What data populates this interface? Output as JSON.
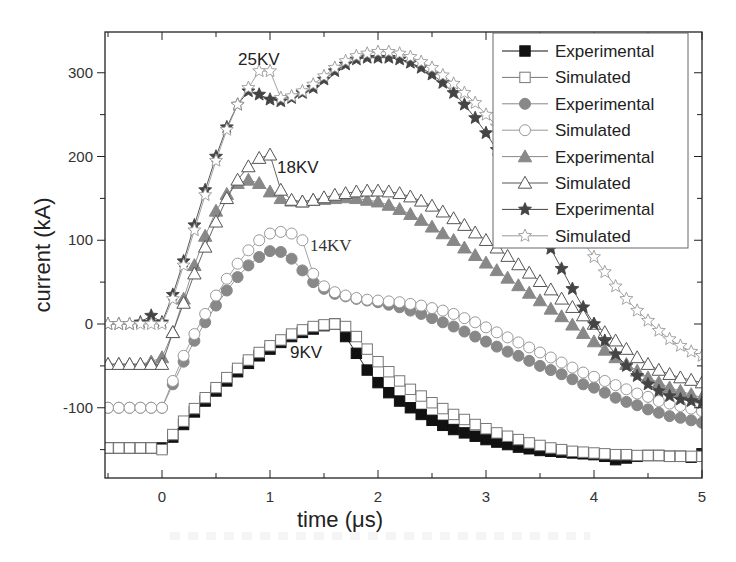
{
  "chart_data": {
    "type": "line",
    "title": "",
    "xlabel": "time (μs)",
    "ylabel": "current (kA)",
    "xlim": [
      -0.55,
      5.0
    ],
    "ylim": [
      -185,
      350
    ],
    "x_ticks": [
      0,
      1,
      2,
      3,
      4,
      5
    ],
    "y_ticks": [
      -100,
      0,
      100,
      200,
      300
    ],
    "grid": false,
    "legend_position": "upper right",
    "annotations": [
      {
        "text": "25KV",
        "x": 0.97,
        "y": 320
      },
      {
        "text": "18KV",
        "x": 1.25,
        "y": 185
      },
      {
        "text": "14KV",
        "x": 1.5,
        "y": 95
      },
      {
        "text": "9KV",
        "x": 1.23,
        "y": -15
      }
    ],
    "series": [
      {
        "name": "Experimental",
        "group": "9KV",
        "marker": "filled-square",
        "color": "#111111",
        "x": [
          -0.5,
          -0.4,
          -0.3,
          -0.2,
          -0.1,
          0.0,
          0.1,
          0.2,
          0.3,
          0.4,
          0.5,
          0.6,
          0.7,
          0.8,
          0.9,
          1.0,
          1.1,
          1.2,
          1.3,
          1.4,
          1.5,
          1.6,
          1.7,
          1.8,
          1.9,
          2.0,
          2.1,
          2.2,
          2.3,
          2.4,
          2.5,
          2.6,
          2.7,
          2.8,
          2.9,
          3.0,
          3.1,
          3.2,
          3.3,
          3.4,
          3.5,
          3.6,
          3.7,
          3.8,
          3.9,
          4.0,
          4.1,
          4.2,
          4.3,
          4.4,
          4.5,
          4.6,
          4.7,
          4.8,
          4.9,
          5.0
        ],
        "y": [
          -148,
          -148,
          -148,
          -148,
          -148,
          -148,
          -135,
          -120,
          -105,
          -92,
          -80,
          -68,
          -57,
          -47,
          -38,
          -30,
          -22,
          -15,
          -10,
          -6,
          -2,
          0,
          -15,
          -35,
          -55,
          -70,
          -82,
          -92,
          -100,
          -108,
          -115,
          -121,
          -126,
          -130,
          -134,
          -138,
          -141,
          -144,
          -147,
          -149,
          -151,
          -152,
          -153,
          -154,
          -155,
          -156,
          -158,
          -162,
          -160,
          -158,
          -157,
          -157,
          -158,
          -158,
          -159,
          -155
        ]
      },
      {
        "name": "Simulated",
        "group": "9KV",
        "marker": "open-square",
        "color": "#777777",
        "x": [
          -0.5,
          -0.4,
          -0.3,
          -0.2,
          -0.1,
          0.0,
          0.1,
          0.2,
          0.3,
          0.4,
          0.5,
          0.6,
          0.7,
          0.8,
          0.9,
          1.0,
          1.1,
          1.2,
          1.3,
          1.4,
          1.5,
          1.6,
          1.7,
          1.8,
          1.9,
          2.0,
          2.1,
          2.2,
          2.3,
          2.4,
          2.5,
          2.6,
          2.7,
          2.8,
          2.9,
          3.0,
          3.1,
          3.2,
          3.3,
          3.4,
          3.5,
          3.6,
          3.7,
          3.8,
          3.9,
          4.0,
          4.1,
          4.2,
          4.3,
          4.4,
          4.5,
          4.6,
          4.7,
          4.8,
          4.9,
          5.0
        ],
        "y": [
          -148,
          -148,
          -148,
          -148,
          -148,
          -150,
          -132,
          -116,
          -101,
          -88,
          -76,
          -64,
          -53,
          -43,
          -34,
          -26,
          -19,
          -12,
          -7,
          -3,
          -1,
          0,
          -3,
          -15,
          -30,
          -45,
          -57,
          -68,
          -78,
          -86,
          -94,
          -101,
          -108,
          -114,
          -120,
          -125,
          -130,
          -134,
          -138,
          -142,
          -145,
          -148,
          -150,
          -152,
          -153,
          -154,
          -155,
          -156,
          -156,
          -157,
          -157,
          -157,
          -158,
          -158,
          -158,
          -158
        ]
      },
      {
        "name": "Experimental",
        "group": "14KV",
        "marker": "filled-circle",
        "color": "#888888",
        "x": [
          -0.5,
          -0.4,
          -0.3,
          -0.2,
          -0.1,
          0.0,
          0.1,
          0.2,
          0.3,
          0.4,
          0.5,
          0.6,
          0.7,
          0.8,
          0.9,
          1.0,
          1.1,
          1.2,
          1.3,
          1.4,
          1.5,
          1.6,
          1.7,
          1.8,
          1.9,
          2.0,
          2.1,
          2.2,
          2.3,
          2.4,
          2.5,
          2.6,
          2.7,
          2.8,
          2.9,
          3.0,
          3.1,
          3.2,
          3.3,
          3.4,
          3.5,
          3.6,
          3.7,
          3.8,
          3.9,
          4.0,
          4.1,
          4.2,
          4.3,
          4.4,
          4.5,
          4.6,
          4.7,
          4.8,
          4.9,
          5.0
        ],
        "y": [
          -100,
          -100,
          -100,
          -100,
          -100,
          -100,
          -72,
          -45,
          -20,
          2,
          22,
          40,
          56,
          70,
          80,
          87,
          86,
          78,
          64,
          50,
          42,
          36,
          33,
          30,
          28,
          26,
          23,
          20,
          16,
          12,
          7,
          2,
          -3,
          -9,
          -15,
          -21,
          -27,
          -33,
          -38,
          -44,
          -50,
          -55,
          -60,
          -66,
          -72,
          -76,
          -82,
          -88,
          -93,
          -97,
          -102,
          -106,
          -110,
          -112,
          -115,
          -118
        ]
      },
      {
        "name": "Simulated",
        "group": "14KV",
        "marker": "open-circle",
        "color": "#999999",
        "x": [
          -0.5,
          -0.4,
          -0.3,
          -0.2,
          -0.1,
          0.0,
          0.1,
          0.2,
          0.3,
          0.4,
          0.5,
          0.6,
          0.7,
          0.8,
          0.9,
          1.0,
          1.1,
          1.2,
          1.3,
          1.4,
          1.5,
          1.6,
          1.7,
          1.8,
          1.9,
          2.0,
          2.1,
          2.2,
          2.3,
          2.4,
          2.5,
          2.6,
          2.7,
          2.8,
          2.9,
          3.0,
          3.1,
          3.2,
          3.3,
          3.4,
          3.5,
          3.6,
          3.7,
          3.8,
          3.9,
          4.0,
          4.1,
          4.2,
          4.3,
          4.4,
          4.5,
          4.6,
          4.7,
          4.8,
          4.9,
          5.0
        ],
        "y": [
          -100,
          -100,
          -100,
          -100,
          -100,
          -100,
          -68,
          -38,
          -12,
          12,
          34,
          54,
          72,
          88,
          100,
          108,
          110,
          108,
          100,
          60,
          45,
          38,
          34,
          31,
          29,
          28,
          27,
          26,
          24,
          22,
          19,
          16,
          12,
          7,
          2,
          -4,
          -10,
          -16,
          -22,
          -28,
          -34,
          -40,
          -46,
          -52,
          -58,
          -63,
          -68,
          -73,
          -78,
          -83,
          -87,
          -92,
          -95,
          -98,
          -101,
          -104
        ]
      },
      {
        "name": "Experimental",
        "group": "18KV",
        "marker": "filled-triangle",
        "color": "#888888",
        "x": [
          -0.5,
          -0.4,
          -0.3,
          -0.2,
          -0.1,
          0.0,
          0.1,
          0.2,
          0.3,
          0.4,
          0.5,
          0.6,
          0.7,
          0.8,
          0.9,
          1.0,
          1.1,
          1.2,
          1.3,
          1.4,
          1.5,
          1.6,
          1.7,
          1.8,
          1.9,
          2.0,
          2.1,
          2.2,
          2.3,
          2.4,
          2.5,
          2.6,
          2.7,
          2.8,
          2.9,
          3.0,
          3.1,
          3.2,
          3.3,
          3.4,
          3.5,
          3.6,
          3.7,
          3.8,
          3.9,
          4.0,
          4.1,
          4.2,
          4.3,
          4.4,
          4.5,
          4.6,
          4.7,
          4.8,
          4.9,
          5.0
        ],
        "y": [
          -48,
          -48,
          -48,
          -48,
          -45,
          -40,
          -10,
          30,
          70,
          105,
          135,
          155,
          168,
          172,
          168,
          158,
          150,
          147,
          146,
          148,
          149,
          150,
          151,
          150,
          148,
          146,
          142,
          137,
          131,
          124,
          116,
          108,
          100,
          91,
          82,
          73,
          64,
          55,
          46,
          37,
          28,
          18,
          9,
          -1,
          -11,
          -21,
          -31,
          -40,
          -48,
          -56,
          -64,
          -70,
          -76,
          -80,
          -84,
          -88
        ]
      },
      {
        "name": "Simulated",
        "group": "18KV",
        "marker": "open-triangle",
        "color": "#555555",
        "x": [
          -0.5,
          -0.4,
          -0.3,
          -0.2,
          -0.1,
          0.0,
          0.1,
          0.2,
          0.3,
          0.4,
          0.5,
          0.6,
          0.7,
          0.8,
          0.9,
          1.0,
          1.1,
          1.2,
          1.3,
          1.4,
          1.5,
          1.6,
          1.7,
          1.8,
          1.9,
          2.0,
          2.1,
          2.2,
          2.3,
          2.4,
          2.5,
          2.6,
          2.7,
          2.8,
          2.9,
          3.0,
          3.1,
          3.2,
          3.3,
          3.4,
          3.5,
          3.6,
          3.7,
          3.8,
          3.9,
          4.0,
          4.1,
          4.2,
          4.3,
          4.4,
          4.5,
          4.6,
          4.7,
          4.8,
          4.9,
          5.0
        ],
        "y": [
          -48,
          -48,
          -48,
          -48,
          -48,
          -48,
          -10,
          25,
          60,
          92,
          122,
          150,
          172,
          188,
          198,
          202,
          160,
          148,
          146,
          148,
          151,
          154,
          156,
          158,
          159,
          159,
          158,
          156,
          152,
          147,
          141,
          134,
          126,
          118,
          109,
          100,
          91,
          81,
          71,
          61,
          51,
          41,
          30,
          20,
          10,
          0,
          -10,
          -20,
          -30,
          -40,
          -48,
          -55,
          -60,
          -64,
          -67,
          -70
        ]
      },
      {
        "name": "Experimental",
        "group": "25KV",
        "marker": "filled-star",
        "color": "#444444",
        "x": [
          -0.5,
          -0.4,
          -0.3,
          -0.2,
          -0.1,
          0.0,
          0.1,
          0.2,
          0.3,
          0.4,
          0.5,
          0.6,
          0.7,
          0.8,
          0.9,
          1.0,
          1.1,
          1.2,
          1.3,
          1.4,
          1.5,
          1.6,
          1.7,
          1.8,
          1.9,
          2.0,
          2.1,
          2.2,
          2.3,
          2.4,
          2.5,
          2.6,
          2.7,
          2.8,
          2.9,
          3.0,
          3.1,
          3.2,
          3.3,
          3.4,
          3.5,
          3.6,
          3.7,
          3.8,
          3.9,
          4.0,
          4.1,
          4.2,
          4.3,
          4.4,
          4.5,
          4.6,
          4.7,
          4.8,
          4.9,
          5.0
        ],
        "y": [
          0,
          0,
          0,
          2,
          10,
          2,
          35,
          75,
          118,
          160,
          200,
          235,
          262,
          278,
          274,
          268,
          266,
          270,
          276,
          282,
          292,
          302,
          310,
          316,
          318,
          318,
          318,
          316,
          312,
          306,
          298,
          288,
          276,
          262,
          246,
          228,
          208,
          186,
          162,
          138,
          114,
          90,
          66,
          42,
          20,
          0,
          -20,
          -36,
          -50,
          -62,
          -72,
          -80,
          -86,
          -90,
          -92,
          -94
        ]
      },
      {
        "name": "Simulated",
        "group": "25KV",
        "marker": "open-star",
        "color": "#999999",
        "x": [
          -0.5,
          -0.4,
          -0.3,
          -0.2,
          -0.1,
          0.0,
          0.1,
          0.2,
          0.3,
          0.4,
          0.5,
          0.6,
          0.7,
          0.8,
          0.9,
          1.0,
          1.1,
          1.2,
          1.3,
          1.4,
          1.5,
          1.6,
          1.7,
          1.8,
          1.9,
          2.0,
          2.1,
          2.2,
          2.3,
          2.4,
          2.5,
          2.6,
          2.7,
          2.8,
          2.9,
          3.0,
          3.1,
          3.2,
          3.3,
          3.4,
          3.5,
          3.6,
          3.7,
          3.8,
          3.9,
          4.0,
          4.1,
          4.2,
          4.3,
          4.4,
          4.5,
          4.6,
          4.7,
          4.8,
          4.9,
          5.0
        ],
        "y": [
          0,
          0,
          0,
          0,
          0,
          0,
          30,
          70,
          112,
          154,
          195,
          232,
          262,
          282,
          302,
          302,
          270,
          272,
          278,
          286,
          296,
          306,
          314,
          320,
          323,
          325,
          325,
          323,
          319,
          313,
          306,
          297,
          287,
          276,
          264,
          250,
          236,
          221,
          205,
          188,
          170,
          152,
          134,
          116,
          98,
          80,
          62,
          45,
          30,
          16,
          4,
          -8,
          -18,
          -26,
          -33,
          -38
        ]
      }
    ]
  },
  "legend": {
    "entries": [
      {
        "label": "Experimental",
        "marker": "filled-square"
      },
      {
        "label": "Simulated",
        "marker": "open-square"
      },
      {
        "label": "Experimental",
        "marker": "filled-circle"
      },
      {
        "label": "Simulated",
        "marker": "open-circle"
      },
      {
        "label": "Experimental",
        "marker": "filled-triangle"
      },
      {
        "label": "Simulated",
        "marker": "open-triangle"
      },
      {
        "label": "Experimental",
        "marker": "filled-star"
      },
      {
        "label": "Simulated",
        "marker": "open-star"
      }
    ]
  },
  "axes": {
    "x_title": "time (μs)",
    "y_title": "current (kA)",
    "x_tick_labels": [
      "0",
      "1",
      "2",
      "3",
      "4",
      "5"
    ],
    "y_tick_labels": [
      "-100",
      "0",
      "100",
      "200",
      "300"
    ]
  },
  "labels": {
    "kv25": "25KV",
    "kv18": "18KV",
    "kv14": "14KV",
    "kv9": "9KV"
  }
}
